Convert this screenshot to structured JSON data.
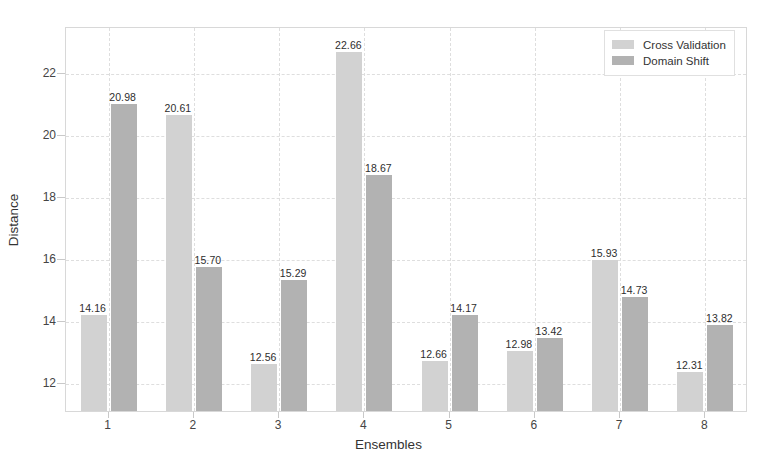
{
  "chart_data": {
    "type": "bar",
    "title": "",
    "xlabel": "Ensembles",
    "ylabel": "Distance",
    "categories": [
      "1",
      "2",
      "3",
      "4",
      "5",
      "6",
      "7",
      "8"
    ],
    "series": [
      {
        "name": "Cross Validation",
        "color": "#d2d2d2",
        "values": [
          14.16,
          20.61,
          12.56,
          22.66,
          12.66,
          12.98,
          15.93,
          12.31
        ],
        "labels": [
          "14.16",
          "20.61",
          "12.56",
          "22.66",
          "12.66",
          "12.98",
          "15.93",
          "12.31"
        ]
      },
      {
        "name": "Domain Shift",
        "color": "#b2b2b2",
        "values": [
          20.98,
          15.7,
          15.29,
          18.67,
          14.17,
          13.42,
          14.73,
          13.82
        ],
        "labels": [
          "20.98",
          "15.70",
          "15.29",
          "18.67",
          "14.17",
          "13.42",
          "14.73",
          "13.82"
        ]
      }
    ],
    "yticks": [
      12,
      14,
      16,
      18,
      20,
      22
    ],
    "ytick_labels": [
      "12",
      "14",
      "16",
      "18",
      "20",
      "22"
    ],
    "ylim": [
      11.05,
      23.5
    ],
    "grid": true,
    "grid_style": "dashed",
    "legend_position": "top-right",
    "legend": [
      "Cross Validation",
      "Domain Shift"
    ],
    "background": "#ffffff",
    "frame_color": "#d8d8d8"
  }
}
